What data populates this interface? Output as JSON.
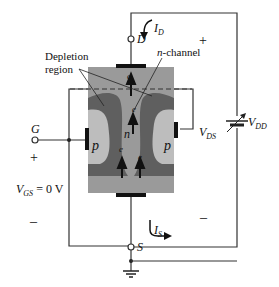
{
  "diagram": {
    "terminals": {
      "drain": "D",
      "gate": "G",
      "source": "S"
    },
    "labels": {
      "depletion_region_line1": "Depletion",
      "depletion_region_line2": "region",
      "n_channel": "n-channel",
      "p_left": "p",
      "p_right": "p",
      "n": "n",
      "electron": "e",
      "vds_main": "V",
      "vds_sub": "DS",
      "vdd_main": "V",
      "vdd_sub": "DD",
      "vgs_main": "V",
      "vgs_sub": "GS",
      "vgs_value": " = 0 V",
      "id_main": "I",
      "id_sub": "D",
      "is_main": "I",
      "is_sub": "S",
      "plus_right": "+",
      "minus_right": "–",
      "plus_left": "+",
      "minus_left": "–"
    },
    "colors": {
      "body": "#9a9a9a",
      "depletion": "#5f5f5f",
      "p_region": "#bdbdbd",
      "wire": "#333333",
      "contact": "#111111"
    }
  }
}
